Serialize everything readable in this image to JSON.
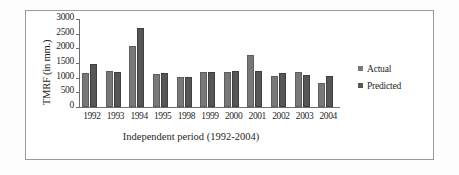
{
  "chart_data": {
    "type": "bar",
    "title": "",
    "xlabel": "Independent period (1992-2004)",
    "ylabel": "TMRF (in mm.)",
    "categories": [
      "1992",
      "1993",
      "1994",
      "1995",
      "1998",
      "1999",
      "2000",
      "2001",
      "2002",
      "2003",
      "2004"
    ],
    "series": [
      {
        "name": "Actual",
        "color": "#787878",
        "values": [
          1170,
          1230,
          2080,
          1140,
          1020,
          1180,
          1210,
          1790,
          1050,
          1210,
          830
        ]
      },
      {
        "name": "Predicted",
        "color": "#565656",
        "values": [
          1460,
          1205,
          2680,
          1170,
          1010,
          1190,
          1215,
          1220,
          1170,
          1100,
          1060
        ]
      }
    ],
    "ylim": [
      0,
      3000
    ],
    "yticks": [
      "0",
      "500",
      "1000",
      "1500",
      "2000",
      "2500",
      "3000"
    ],
    "ytick_values": [
      0,
      500,
      1000,
      1500,
      2000,
      2500,
      3000
    ],
    "grid": false,
    "legend_position": "right"
  }
}
